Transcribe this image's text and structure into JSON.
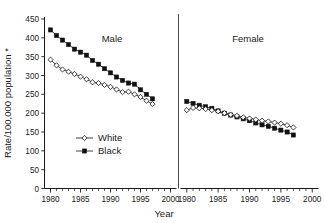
{
  "chart_data": {
    "type": "line",
    "title": "",
    "xlabel": "Year",
    "ylabel": "Rate/100,000 population *",
    "ylim": [
      0,
      450
    ],
    "ytick_labels": [
      "0",
      "50",
      "100",
      "150",
      "200",
      "250",
      "300",
      "350",
      "400",
      "450"
    ],
    "ytick_values": [
      0,
      50,
      100,
      150,
      200,
      250,
      300,
      350,
      400,
      450
    ],
    "xlim": [
      1979,
      2001
    ],
    "xtick_labels": [
      "1980",
      "1985",
      "1990",
      "1995",
      "2000"
    ],
    "xtick_values": [
      1980,
      1985,
      1990,
      1995,
      2000
    ],
    "grid": false,
    "legend_position": "inner-lower-left",
    "legend": [
      {
        "name": "White",
        "marker": "open-diamond",
        "color": "#ffffff",
        "edge": "#111111"
      },
      {
        "name": "Black",
        "marker": "filled-square",
        "color": "#111111",
        "edge": "#111111"
      }
    ],
    "panels": [
      {
        "name": "Male",
        "title": "Male",
        "x": [
          1980,
          1981,
          1982,
          1983,
          1984,
          1985,
          1986,
          1987,
          1988,
          1989,
          1990,
          1991,
          1992,
          1993,
          1994,
          1995,
          1996,
          1997
        ],
        "series": [
          {
            "name": "Black",
            "values": [
              421,
              406,
              394,
              382,
              370,
              362,
              354,
              340,
              330,
              318,
              307,
              296,
              287,
              280,
              277,
              262,
              250,
              238
            ]
          },
          {
            "name": "White",
            "values": [
              342,
              327,
              316,
              310,
              304,
              297,
              290,
              282,
              280,
              275,
              270,
              263,
              256,
              257,
              250,
              243,
              233,
              224
            ]
          }
        ]
      },
      {
        "name": "Female",
        "title": "Female",
        "x": [
          1980,
          1981,
          1982,
          1983,
          1984,
          1985,
          1986,
          1987,
          1988,
          1989,
          1990,
          1991,
          1992,
          1993,
          1994,
          1995,
          1996,
          1997
        ],
        "series": [
          {
            "name": "Black",
            "values": [
              231,
              226,
              221,
              217,
              213,
              206,
              200,
              195,
              190,
              185,
              180,
              174,
              169,
              165,
              160,
              155,
              150,
              142
            ]
          },
          {
            "name": "White",
            "values": [
              208,
              214,
              213,
              211,
              208,
              205,
              200,
              196,
              193,
              189,
              186,
              183,
              180,
              178,
              175,
              172,
              168,
              162
            ]
          }
        ]
      }
    ]
  },
  "footnote_marker": "*"
}
